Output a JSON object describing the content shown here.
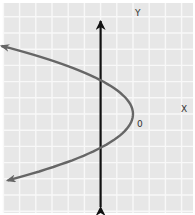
{
  "chart_data": {
    "type": "line",
    "title": "",
    "labels": {
      "y_axis": "Y",
      "x_axis": "X",
      "vertex": "0"
    },
    "grid": true,
    "grid_unit": 1,
    "x_range": [
      -8,
      3
    ],
    "y_range": [
      -6,
      7
    ],
    "vertical_line": {
      "x": -2,
      "arrows": "both"
    },
    "parabola": {
      "form": "x = a*(y - k)^2 + h",
      "vertex": [
        0,
        0
      ],
      "a": -0.46,
      "y_extent": [
        -4.1,
        4.2
      ],
      "arrows": "both"
    },
    "colors": {
      "background": "#e7e7e7",
      "grid": "#f8f8f8",
      "parabola": "#666666",
      "axis": "#111111",
      "label": "#333333"
    }
  }
}
